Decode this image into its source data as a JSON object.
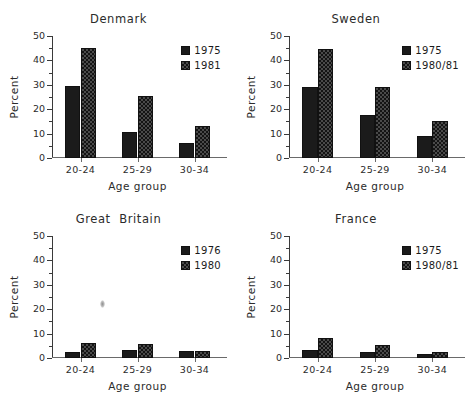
{
  "figure": {
    "ylabel": "Percent",
    "xlabel": "Age group",
    "categories": [
      "20-24",
      "25-29",
      "30-34"
    ],
    "yticks": [
      "0",
      "10",
      "20",
      "30",
      "40",
      "50"
    ],
    "ylim": [
      0,
      50
    ]
  },
  "chart_data": [
    {
      "type": "bar",
      "title": "Denmark",
      "xlabel": "Age group",
      "ylabel": "Percent",
      "ylim": [
        0,
        50
      ],
      "grid": false,
      "legend_position": "upper right",
      "categories": [
        "20-24",
        "25-29",
        "30-34"
      ],
      "series": [
        {
          "name": "1975",
          "values": [
            29.5,
            10.7,
            6.0
          ]
        },
        {
          "name": "1981",
          "values": [
            45.2,
            25.5,
            13.0
          ]
        }
      ]
    },
    {
      "type": "bar",
      "title": "Sweden",
      "xlabel": "Age group",
      "ylabel": "Percent",
      "ylim": [
        0,
        50
      ],
      "grid": false,
      "legend_position": "upper right",
      "categories": [
        "20-24",
        "25-29",
        "30-34"
      ],
      "series": [
        {
          "name": "1975",
          "values": [
            29.3,
            17.7,
            9.0
          ]
        },
        {
          "name": "1980/81",
          "values": [
            44.8,
            29.3,
            15.0
          ]
        }
      ]
    },
    {
      "type": "bar",
      "title": "Great  Britain",
      "xlabel": "Age group",
      "ylabel": "Percent",
      "ylim": [
        0,
        50
      ],
      "grid": false,
      "legend_position": "upper right",
      "categories": [
        "20-24",
        "25-29",
        "30-34"
      ],
      "series": [
        {
          "name": "1976",
          "values": [
            2.5,
            3.3,
            2.8
          ]
        },
        {
          "name": "1980",
          "values": [
            6.3,
            5.6,
            3.0
          ]
        }
      ]
    },
    {
      "type": "bar",
      "title": "France",
      "xlabel": "Age group",
      "ylabel": "Percent",
      "ylim": [
        0,
        50
      ],
      "grid": false,
      "legend_position": "upper right",
      "categories": [
        "20-24",
        "25-29",
        "30-34"
      ],
      "series": [
        {
          "name": "1975",
          "values": [
            3.3,
            2.3,
            1.6
          ]
        },
        {
          "name": "1980/81",
          "values": [
            8.4,
            5.5,
            2.6
          ]
        }
      ]
    }
  ]
}
